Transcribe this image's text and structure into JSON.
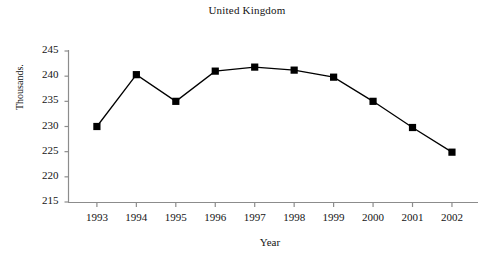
{
  "chart_data": {
    "type": "line",
    "title": "United Kingdom",
    "xlabel": "Year",
    "ylabel": "Thousands.",
    "categories": [
      "1993",
      "1994",
      "1995",
      "1996",
      "1997",
      "1998",
      "1999",
      "2000",
      "2001",
      "2002"
    ],
    "values": [
      230.0,
      240.3,
      235.0,
      241.0,
      241.8,
      241.2,
      239.8,
      235.0,
      229.8,
      224.9
    ],
    "x": [
      1993,
      1994,
      1995,
      1996,
      1997,
      1998,
      1999,
      2000,
      2001,
      2002
    ],
    "ylim": [
      215,
      245
    ],
    "yticks": [
      215,
      220,
      225,
      230,
      235,
      240,
      245
    ],
    "ytick_labels": [
      "215",
      "220",
      "225",
      "230",
      "235",
      "240",
      "245"
    ],
    "xtick_labels": [
      "1993",
      "1994",
      "1995",
      "1996",
      "1997",
      "1998",
      "1999",
      "2000",
      "2001",
      "2002"
    ],
    "grid": false,
    "legend": null,
    "legend_position": "none",
    "series": [
      {
        "name": "United Kingdom",
        "values": [
          230.0,
          240.3,
          235.0,
          241.0,
          241.8,
          241.2,
          239.8,
          235.0,
          229.8,
          224.9
        ],
        "marker": "square",
        "marker_color": "#000000",
        "line_color": "#000000"
      }
    ],
    "colors": {
      "line": "#000000",
      "marker": "#000000",
      "axis": "#8c8c8c",
      "text": "#141414",
      "background": "#ffffff"
    }
  }
}
